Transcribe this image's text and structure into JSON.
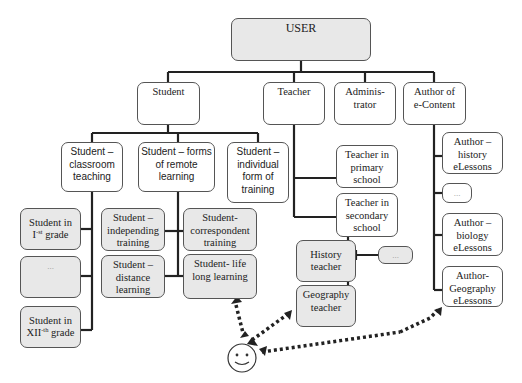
{
  "diagram": {
    "type": "hierarchy",
    "root": {
      "id": "user",
      "label": "USER"
    },
    "level1": [
      {
        "id": "student",
        "label": "Student"
      },
      {
        "id": "teacher",
        "label": "Teacher"
      },
      {
        "id": "administrator",
        "label": "Adminis-trator",
        "line1": "Adminis-",
        "line2": "trator"
      },
      {
        "id": "author",
        "label": "Author of e-Content",
        "line1": "Author of",
        "line2": "e-Content"
      }
    ],
    "student_branches": [
      {
        "id": "student-classroom",
        "label": "Student – classroom teaching",
        "lines": [
          "Student –",
          "classroom",
          "teaching"
        ]
      },
      {
        "id": "student-remote",
        "label": "Student – forms of remote learning",
        "lines": [
          "Student – forms",
          "of remote",
          "learning"
        ]
      },
      {
        "id": "student-individual",
        "label": "Student – individual form of training",
        "lines": [
          "Student –",
          "individual",
          "form of",
          "training"
        ]
      }
    ],
    "classroom_children": [
      {
        "id": "grade-1",
        "label": "Student in I-st grade",
        "line1": "Student in",
        "roman": "I",
        "sup": "-st",
        "rest": " grade"
      },
      {
        "id": "grade-ellipsis",
        "label": "..."
      },
      {
        "id": "grade-12",
        "label": "Student in XII-th grade",
        "line1": "Student in",
        "roman": "XII",
        "sup": "-th",
        "rest": " grade"
      }
    ],
    "remote_children": [
      {
        "id": "independing",
        "label": "Student – independing training",
        "lines": [
          "Student –",
          "independing",
          "training"
        ]
      },
      {
        "id": "distance",
        "label": "Student – distance learning",
        "lines": [
          "Student –",
          "distance",
          "learning"
        ]
      },
      {
        "id": "correspondent",
        "label": "Student- correspondent training",
        "lines": [
          "Student-",
          "correspondent",
          "training"
        ]
      },
      {
        "id": "lifelong",
        "label": "Student- life long learning",
        "lines": [
          "Student- life",
          "long learning"
        ]
      }
    ],
    "teacher_children": [
      {
        "id": "primary",
        "label": "Teacher in primary school",
        "lines": [
          "Teacher in",
          "primary",
          "school"
        ]
      },
      {
        "id": "secondary",
        "label": "Teacher in secondary school",
        "lines": [
          "Teacher in",
          "secondary",
          "school"
        ]
      }
    ],
    "secondary_children": [
      {
        "id": "history-teacher",
        "label": "History teacher",
        "lines": [
          "History",
          "teacher"
        ]
      },
      {
        "id": "geography-teacher",
        "label": "Geography teacher",
        "lines": [
          "Geography",
          "teacher"
        ]
      },
      {
        "id": "teacher-ellipsis",
        "label": "..."
      }
    ],
    "author_children": [
      {
        "id": "author-history",
        "label": "Author – history eLessons",
        "lines": [
          "Author –",
          "history",
          "eLessons"
        ]
      },
      {
        "id": "author-ellipsis",
        "label": "..."
      },
      {
        "id": "author-biology",
        "label": "Author – biology eLessons",
        "lines": [
          "Author –",
          "biology",
          "eLessons"
        ]
      },
      {
        "id": "author-geography",
        "label": "Author- Geography eLessons",
        "lines": [
          "Author-",
          "Geography",
          "eLessons"
        ]
      }
    ],
    "actor": {
      "id": "end-user",
      "icon": "smiley-face-icon"
    },
    "dotted_links": [
      {
        "from": "end-user",
        "to": "lifelong"
      },
      {
        "from": "end-user",
        "to": "geography-teacher"
      },
      {
        "from": "end-user",
        "to": "author-geography"
      }
    ],
    "colors": {
      "line": "#222222",
      "box_border": "#555555",
      "grey_fill": "#e8e8e8",
      "white_fill": "#ffffff"
    }
  }
}
